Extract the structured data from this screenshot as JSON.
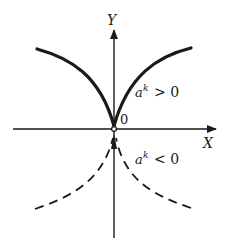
{
  "diagram": {
    "axes": {
      "x_label": "X",
      "y_label": "Y",
      "origin_label": "0"
    },
    "curves": [
      {
        "name": "upper-cusp",
        "style": "solid",
        "condition_base": "a",
        "condition_exp": "k",
        "condition_rel": "> 0"
      },
      {
        "name": "lower-cusp",
        "style": "dashed",
        "condition_base": "a",
        "condition_exp": "k",
        "condition_rel": "< 0"
      }
    ],
    "colors": {
      "ink": "#1a1a1a",
      "background": "#ffffff"
    }
  }
}
